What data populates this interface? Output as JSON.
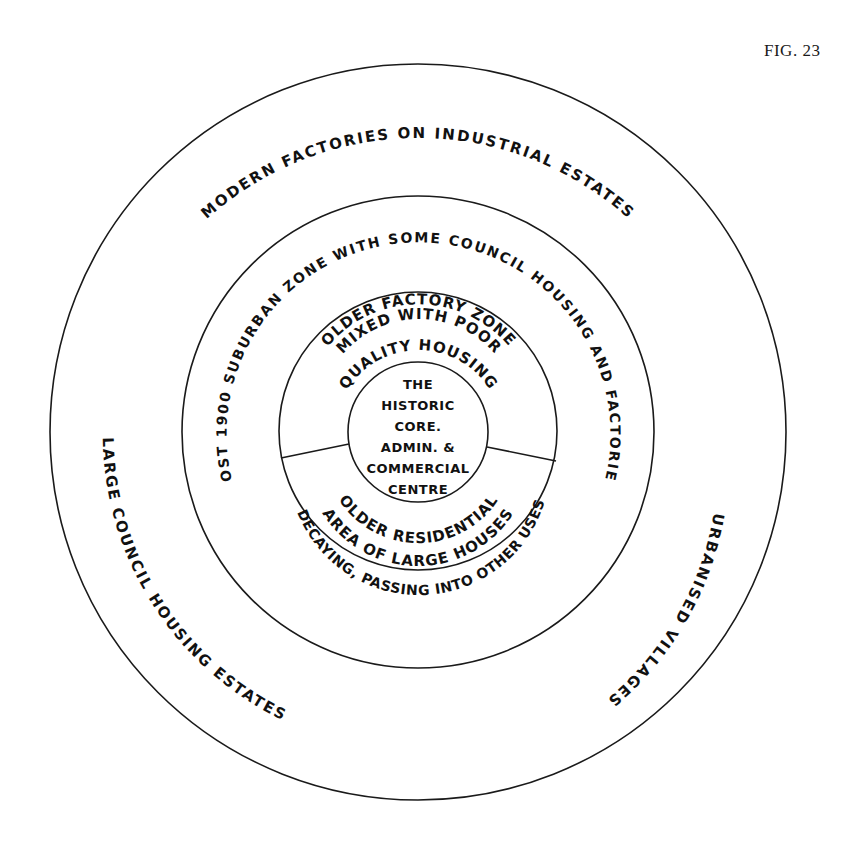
{
  "figure": {
    "label": "FIG. 23"
  },
  "zones": {
    "outer": {
      "top": "MODERN   FACTORIES   ON   INDUSTRIAL      ESTATES",
      "left": "LARGE    COUNCIL    HOUSING    ESTATES",
      "right": "URBANISED    VILLAGES"
    },
    "middle": {
      "label": "POST   1900   SUBURBAN   ZONE   WITH   SOME   COUNCIL   HOUSING   AND   FACTORIES"
    },
    "inner_upper": {
      "line1": "OLDER  FACTORY   ZONE",
      "line2": "MIXED  WITH  POOR",
      "line3": "QUALITY  HOUSING"
    },
    "inner_lower": {
      "line1": "OLDER  RESIDENTIAL",
      "line2": "AREA   OF  LARGE  HOUSES",
      "line3": "DECAYING, PASSING INTO OTHER USES"
    },
    "core": {
      "lines": [
        "THE",
        "HISTORIC",
        "CORE.",
        "ADMIN. &",
        "COMMERCIAL",
        "CENTRE"
      ]
    }
  },
  "colors": {
    "ink": "#1a1a1a",
    "paper": "#ffffff"
  }
}
